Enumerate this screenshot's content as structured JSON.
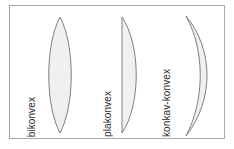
{
  "figure": {
    "type": "lens-shapes-diagram",
    "background_color": "#ffffff",
    "frame": {
      "border_color": "#a8a8a8",
      "fill_color": "#ffffff"
    },
    "lens_style": {
      "fill_color": "#f0f0f0",
      "stroke_color": "#808080"
    },
    "lenses": [
      {
        "id": "bikonvex",
        "label": "bikonvex",
        "shape": "biconvex",
        "description": "symmetric lens, both surfaces convex",
        "path": "M 60 17 C 75 45, 75 105, 60 133 C 45 105, 45 45, 60 17 Z"
      },
      {
        "id": "plakonvex",
        "label": "plakonvex",
        "shape": "plano-convex",
        "description": "flat left surface, convex right surface",
        "path": "M 122 17 L 122 133 C 141 105, 141 45, 122 17 Z"
      },
      {
        "id": "konkav-konvex",
        "label": "konkav-konvex",
        "shape": "concave-convex meniscus",
        "description": "crescent shaped meniscus, concave left, convex right",
        "path": "M 186 16 C 214 50, 214 100, 186 136 C 205 100, 205 50, 186 16 Z"
      }
    ]
  }
}
